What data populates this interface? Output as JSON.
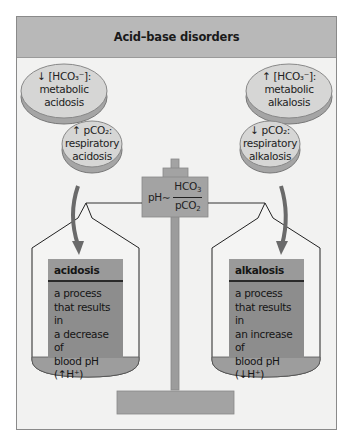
{
  "title": "Acid–base disorders",
  "discs": {
    "metabolic_acidosis": {
      "arrow": "↓",
      "line1": "[HCO₃⁻]:",
      "line2": "metabolic",
      "line3": "acidosis"
    },
    "respiratory_acidosis": {
      "arrow": "↑",
      "line1": "pCO₂:",
      "line2": "respiratory",
      "line3": "acidosis"
    },
    "metabolic_alkalosis": {
      "arrow": "↑",
      "line1": "[HCO₃⁻]:",
      "line2": "metabolic",
      "line3": "alkalosis"
    },
    "respiratory_alkalosis": {
      "arrow": "↓",
      "line1": "pCO₂:",
      "line2": "respiratory",
      "line3": "alkalosis"
    }
  },
  "formula": {
    "lhs": "pH∼",
    "numerator": "HCO",
    "numerator_sub": "3",
    "denominator": "pCO",
    "denominator_sub": "2"
  },
  "acidosis_card": {
    "title": "acidosis",
    "line1": "a process",
    "line2": "that results in",
    "line3": "a decrease of",
    "line4": "blood pH (↑H⁺)"
  },
  "alkalosis_card": {
    "title": "alkalosis",
    "line1": "a process",
    "line2": "that results in",
    "line3": "an increase of",
    "line4": "blood pH (↓H⁺)"
  },
  "colors": {
    "header_bg": "#b8b8b8",
    "panel_bg": "#f2f2f1",
    "disc_fill": "#d4d4d3",
    "disc_side": "#a5a5a5",
    "scale_gray": "#a3a3a3",
    "card_fill": "#8d8d8d",
    "arrow": "#6a6a6a"
  }
}
